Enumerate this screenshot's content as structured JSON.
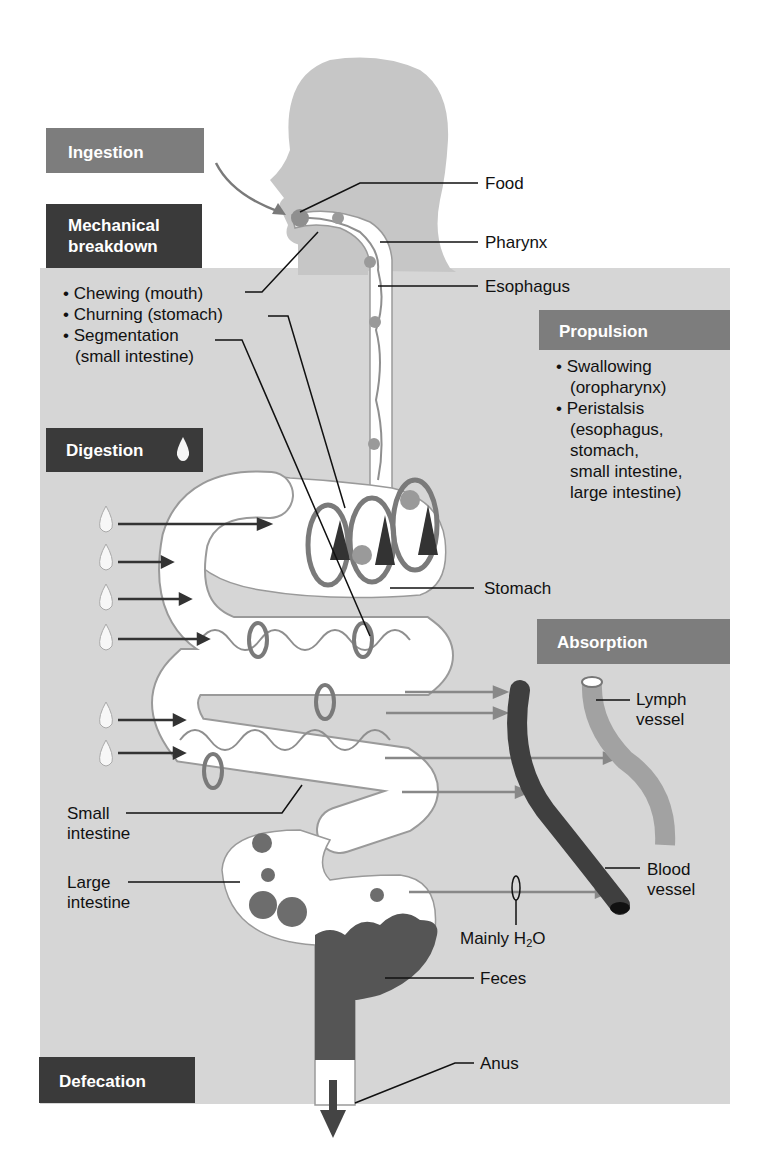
{
  "stages": {
    "ingestion": {
      "label": "Ingestion"
    },
    "mechanical_breakdown": {
      "label_line1": "Mechanical",
      "label_line2": "breakdown",
      "items": [
        "• Chewing (mouth)",
        "• Churning (stomach)",
        "• Segmentation",
        "(small intestine)"
      ]
    },
    "digestion": {
      "label": "Digestion"
    },
    "propulsion": {
      "label": "Propulsion",
      "items": [
        "• Swallowing",
        "(oropharynx)",
        "• Peristalsis",
        "(esophagus,",
        "stomach,",
        "small intestine,",
        "large intestine)"
      ]
    },
    "absorption": {
      "label": "Absorption"
    },
    "defecation": {
      "label": "Defecation"
    }
  },
  "anatomy_labels": {
    "food": "Food",
    "pharynx": "Pharynx",
    "esophagus": "Esophagus",
    "stomach": "Stomach",
    "lymph_vessel_1": "Lymph",
    "lymph_vessel_2": "vessel",
    "blood_vessel_1": "Blood",
    "blood_vessel_2": "vessel",
    "mainly_h2o_prefix": "Mainly H",
    "mainly_h2o_sub": "2",
    "mainly_h2o_suffix": "O",
    "small_intestine_1": "Small",
    "small_intestine_2": "intestine",
    "large_intestine_1": "Large",
    "large_intestine_2": "intestine",
    "feces": "Feces",
    "anus": "Anus"
  },
  "colors": {
    "panel_bg": "#d4d4d4",
    "silhouette": "#c4c4c4",
    "dark_header": "#3a3a3a",
    "mid_header": "#7d7d7d",
    "tract": "#ffffff",
    "food_particles": "#8e8e8e",
    "feces": "#555555",
    "blood_vessel": "#4a4a4a",
    "lymph_vessel": "#9a9a9a"
  }
}
